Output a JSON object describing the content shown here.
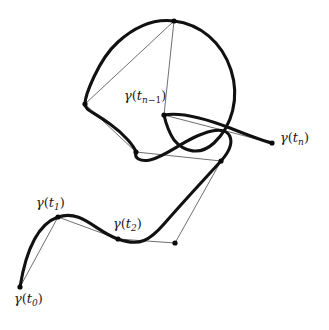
{
  "figure": {
    "width": 329,
    "height": 330,
    "background_color": "#ffffff",
    "curve_color": "#111111",
    "chord_color": "#555555",
    "node_color": "#0a0a0a"
  },
  "labels": {
    "t0": {
      "gamma": "γ",
      "open": "(",
      "var": "t",
      "sub": "0",
      "close": ")",
      "text": "γ(t₀)"
    },
    "t1": {
      "gamma": "γ",
      "open": "(",
      "var": "t",
      "sub": "1",
      "close": ")",
      "text": "γ(t₁)"
    },
    "t2": {
      "gamma": "γ",
      "open": "(",
      "var": "t",
      "sub": "2",
      "close": ")",
      "text": "γ(t₂)"
    },
    "tnm1": {
      "gamma": "γ",
      "open": "(",
      "var": "t",
      "sub_n": "n",
      "sub_minus": "−",
      "sub_one": "1",
      "close": ")",
      "text": "γ(tₙ₋₁)"
    },
    "tn": {
      "gamma": "γ",
      "open": "(",
      "var": "t",
      "sub": "n",
      "close": ")",
      "text": "γ(tₙ)"
    }
  },
  "chart_data": {
    "type": "line",
    "xlabel": "",
    "ylabel": "",
    "xlim": [
      0,
      329
    ],
    "ylim": [
      330,
      0
    ],
    "grid": false,
    "legend": "none",
    "annotations": [
      {
        "name": "gamma-t0",
        "text": "γ(t₀)",
        "point": [
          20,
          287
        ],
        "label_pos": [
          14,
          292
        ]
      },
      {
        "name": "gamma-t1",
        "text": "γ(t₁)",
        "point": [
          58,
          217
        ],
        "label_pos": [
          36,
          196
        ]
      },
      {
        "name": "gamma-t2",
        "text": "γ(t₂)",
        "point": [
          118,
          239
        ],
        "label_pos": [
          113,
          217
        ]
      },
      {
        "name": "gamma-tnm1",
        "text": "γ(tₙ₋₁)",
        "point": [
          164,
          115
        ],
        "label_pos": [
          124,
          89
        ]
      },
      {
        "name": "gamma-tn",
        "text": "γ(tₙ)",
        "point": [
          272,
          143
        ],
        "label_pos": [
          280,
          131
        ]
      }
    ],
    "series": [
      {
        "name": "curve",
        "kind": "smooth-curve",
        "stroke": "#111111",
        "stroke_width": 3.1,
        "path": "M 20 287 C 26 250 38 224 58 217 C 82 209 96 232 118 239 C 140 247 150 240 164 224 C 184 201 200 184 221 161 C 237 143 233 127 212 131 C 188 136 168 156 150 160 C 140 162 134 158 136 152 C 134 146 124 134 110 124 C 92 111 85 110 85 104 C 85 96 98 60 118 42 C 138 24 158 19 174 21 C 200 24 222 42 231 70 C 240 98 232 126 214 143 C 200 156 184 152 174 140 C 170 134 166 124 164 115 C 180 112 204 118 230 128 C 250 136 264 141 272 143"
      },
      {
        "name": "chords",
        "kind": "polyline",
        "stroke": "#555555",
        "stroke_width": 0.85,
        "vertices": [
          [
            20,
            287
          ],
          [
            58,
            217
          ],
          [
            118,
            239
          ],
          [
            175,
            243
          ],
          [
            221,
            161
          ],
          [
            136,
            152
          ],
          [
            85,
            104
          ],
          [
            174,
            21
          ],
          [
            164,
            115
          ],
          [
            272,
            143
          ]
        ]
      }
    ],
    "nodes": [
      {
        "name": "node-t0",
        "x": 20,
        "y": 287,
        "r": 2.6,
        "labeled": true,
        "label": "γ(t₀)"
      },
      {
        "name": "node-t1",
        "x": 58,
        "y": 217,
        "r": 2.6,
        "labeled": true,
        "label": "γ(t₁)"
      },
      {
        "name": "node-t2",
        "x": 118,
        "y": 239,
        "r": 2.6,
        "labeled": true,
        "label": "γ(t₂)"
      },
      {
        "name": "node-3",
        "x": 175,
        "y": 243,
        "r": 2.6,
        "labeled": false,
        "label": ""
      },
      {
        "name": "node-4",
        "x": 221,
        "y": 161,
        "r": 2.6,
        "labeled": false,
        "label": ""
      },
      {
        "name": "node-5",
        "x": 136,
        "y": 152,
        "r": 2.6,
        "labeled": false,
        "label": ""
      },
      {
        "name": "node-6",
        "x": 85,
        "y": 104,
        "r": 2.6,
        "labeled": false,
        "label": ""
      },
      {
        "name": "node-7",
        "x": 174,
        "y": 21,
        "r": 2.6,
        "labeled": false,
        "label": ""
      },
      {
        "name": "node-tnm1",
        "x": 164,
        "y": 115,
        "r": 2.6,
        "labeled": true,
        "label": "γ(tₙ₋₁)"
      },
      {
        "name": "node-tn",
        "x": 272,
        "y": 143,
        "r": 2.6,
        "labeled": true,
        "label": "γ(tₙ)"
      }
    ]
  }
}
